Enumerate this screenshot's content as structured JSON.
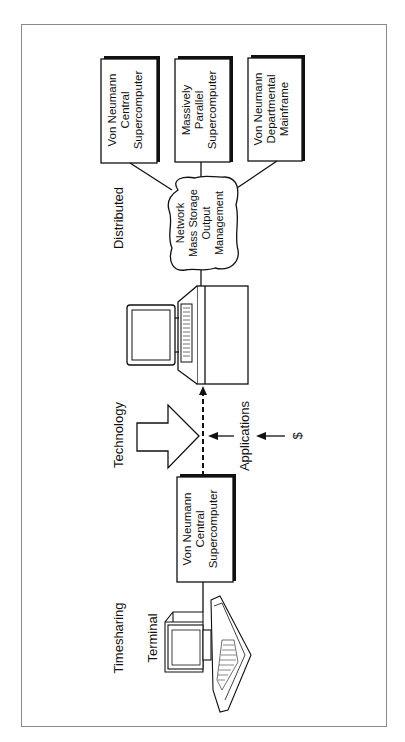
{
  "diagram": {
    "title": "",
    "orientation": "rotated-90-ccw",
    "sections": {
      "timesharing": {
        "label": "Timesharing"
      },
      "technology": {
        "label": "Technology"
      },
      "distributed": {
        "label": "Distributed"
      }
    },
    "nodes": {
      "terminal": {
        "label": "Terminal"
      },
      "central_supercomputer_timesharing": {
        "lines": [
          "Von Neumann",
          "Central",
          "Supercomputer"
        ]
      },
      "network_cloud": {
        "lines": [
          "Network",
          "Mass Storage",
          "Output",
          "Management"
        ]
      },
      "central_supercomputer_distributed": {
        "lines": [
          "Von Neumann",
          "Central",
          "Supercomputer"
        ]
      },
      "massively_parallel": {
        "lines": [
          "Massively",
          "Parallel",
          "Supercomputer"
        ]
      },
      "departmental_mainframe": {
        "lines": [
          "Von Neumann",
          "Departmental",
          "Mainframe"
        ]
      }
    },
    "drivers": {
      "applications": {
        "label": "Applications"
      },
      "money": {
        "label": "$"
      }
    },
    "edges": [
      {
        "from": "terminal",
        "to": "central_supercomputer_timesharing",
        "style": "solid"
      },
      {
        "from": "central_supercomputer_timesharing",
        "to": "workstation",
        "style": "dashed-arrow"
      },
      {
        "from": "workstation",
        "to": "network_cloud",
        "style": "solid"
      },
      {
        "from": "network_cloud",
        "to": "central_supercomputer_distributed",
        "style": "solid"
      },
      {
        "from": "network_cloud",
        "to": "massively_parallel",
        "style": "solid"
      },
      {
        "from": "network_cloud",
        "to": "departmental_mainframe",
        "style": "solid"
      }
    ],
    "colors": {
      "stroke": "#111111",
      "frame": "#8a8a8a",
      "background": "#ffffff"
    }
  }
}
